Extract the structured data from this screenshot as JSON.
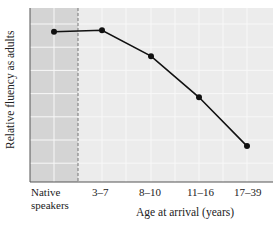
{
  "chart_data": {
    "type": "line",
    "title": "",
    "xlabel": "Age at arrival (years)",
    "ylabel": "Relative fluency as adults",
    "categories": [
      "Native speakers",
      "3–7",
      "8–10",
      "11–16",
      "17–39"
    ],
    "category_lines": [
      [
        "Native",
        "speakers"
      ],
      [
        "3–7"
      ],
      [
        "8–10"
      ],
      [
        "11–16"
      ],
      [
        "17–39"
      ]
    ],
    "values": [
      0.91,
      0.92,
      0.75,
      0.48,
      0.16
    ],
    "ylim": [
      0,
      1
    ],
    "yticks_labeled": false,
    "grid": true,
    "shaded_region": "Native speakers",
    "dashed_separator": "between Native speakers and 3–7",
    "colors": {
      "plot_bg": "#ececec",
      "native_bg": "#d4d4d4",
      "grid": "#f8f8f8",
      "line": "#111111",
      "axis": "#555555"
    }
  }
}
